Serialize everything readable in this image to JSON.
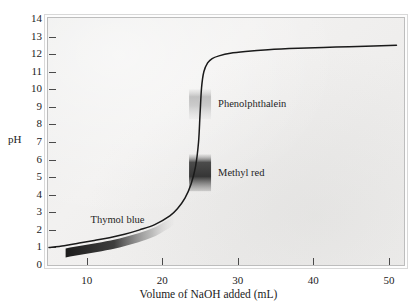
{
  "chart_data": {
    "type": "line",
    "title": "",
    "xlabel": "Volume of NaOH added (mL)",
    "ylabel": "pH",
    "xlim": [
      5,
      52
    ],
    "ylim": [
      0,
      14
    ],
    "xticks": [
      10,
      20,
      30,
      40,
      50
    ],
    "yticks": [
      0,
      1,
      2,
      3,
      4,
      5,
      6,
      7,
      8,
      9,
      10,
      11,
      12,
      13,
      14
    ],
    "grid": false,
    "legend": "none",
    "series": [
      {
        "name": "Titration curve",
        "x": [
          5.0,
          7.0,
          9.0,
          11.0,
          13.0,
          15.0,
          17.0,
          19.0,
          21.0,
          22.0,
          23.0,
          23.8,
          24.4,
          24.8,
          25.0,
          25.2,
          25.5,
          26.0,
          26.6,
          27.5,
          29.0,
          31.0,
          34.0,
          38.0,
          43.0,
          48.0,
          51.0
        ],
        "y": [
          1.0,
          1.1,
          1.25,
          1.4,
          1.55,
          1.75,
          2.0,
          2.3,
          2.8,
          3.2,
          3.8,
          4.6,
          5.6,
          7.0,
          8.6,
          10.1,
          11.0,
          11.5,
          11.75,
          11.9,
          12.05,
          12.15,
          12.25,
          12.33,
          12.4,
          12.46,
          12.5
        ]
      }
    ],
    "annotations": [
      {
        "text": "Phenolphthalein",
        "ph_range": [
          8.3,
          10.0
        ],
        "x_mL": 25.0
      },
      {
        "text": "Methyl red",
        "ph_range": [
          4.2,
          6.3
        ],
        "x_mL": 25.0
      },
      {
        "text": "Thymol blue",
        "ph_range": [
          1.2,
          2.8
        ],
        "x_mL": 14.0
      }
    ]
  },
  "axes": {
    "y_title": "pH",
    "x_title": "Volume of NaOH added (mL)",
    "y_tick_labels": [
      "14",
      "13",
      "12",
      "11",
      "10",
      "9",
      "8",
      "7",
      "6",
      "5",
      "4",
      "3",
      "2",
      "1",
      "0"
    ],
    "x_tick_labels": [
      "10",
      "20",
      "30",
      "40",
      "50"
    ]
  },
  "indicators": [
    {
      "name": "phenolphthalein",
      "label": "Phenolphthalein"
    },
    {
      "name": "methyl-red",
      "label": "Methyl red"
    },
    {
      "name": "thymol-blue",
      "label": "Thymol blue"
    }
  ],
  "colors": {
    "curve": "#1a1a1a",
    "plot_background": "#efeeed",
    "frame": "#c9c9c9",
    "text": "#1b1b1b",
    "phenolphthalein_band": "#b9b9b9",
    "methyl_red_band": "#3a3a3a",
    "thymol_blue_band": "#2b2b2b"
  }
}
